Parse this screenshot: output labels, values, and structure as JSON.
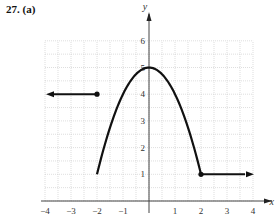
{
  "problem_label": "27. (a)",
  "chart_data": {
    "type": "line",
    "title": "",
    "xlabel": "x",
    "ylabel": "y",
    "xlim": [
      -4,
      4
    ],
    "ylim": [
      0,
      6
    ],
    "grid": true,
    "x_ticks": [
      "−4",
      "−3",
      "−2",
      "−1",
      "1",
      "2",
      "3",
      "4"
    ],
    "y_ticks": [
      "1",
      "2",
      "3",
      "4",
      "5",
      "6"
    ],
    "pieces": [
      {
        "kind": "ray",
        "direction": "left",
        "from": [
          -2,
          4
        ],
        "endpoint": "closed",
        "y": 4
      },
      {
        "kind": "curve",
        "description": "downward parabola y = 5 - x^2",
        "x_range": [
          -2,
          2
        ],
        "start": [
          -2,
          1
        ],
        "vertex": [
          0,
          5
        ],
        "end": [
          2,
          1
        ],
        "start_endpoint": "open"
      },
      {
        "kind": "ray",
        "direction": "right",
        "from": [
          2,
          1
        ],
        "endpoint": "closed",
        "y": 1
      }
    ],
    "points": [
      {
        "x": -2,
        "y": 4,
        "style": "closed"
      },
      {
        "x": 2,
        "y": 1,
        "style": "closed"
      }
    ]
  }
}
